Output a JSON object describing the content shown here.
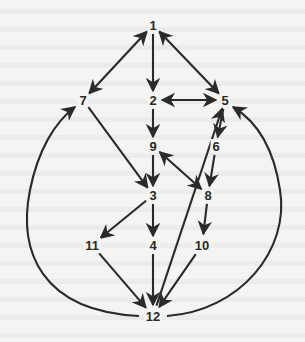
{
  "diagram": {
    "type": "directed-graph",
    "colors": {
      "ink": "#2a2a2a",
      "paper": "#f4f4f2"
    },
    "nodes": [
      {
        "id": "1",
        "label": "1",
        "x": 153,
        "y": 25
      },
      {
        "id": "2",
        "label": "2",
        "x": 153,
        "y": 100
      },
      {
        "id": "5",
        "label": "5",
        "x": 225,
        "y": 100
      },
      {
        "id": "7",
        "label": "7",
        "x": 83,
        "y": 100
      },
      {
        "id": "9",
        "label": "9",
        "x": 153,
        "y": 146
      },
      {
        "id": "6",
        "label": "6",
        "x": 216,
        "y": 146
      },
      {
        "id": "3",
        "label": "3",
        "x": 153,
        "y": 195
      },
      {
        "id": "8",
        "label": "8",
        "x": 208,
        "y": 195
      },
      {
        "id": "11",
        "label": "11",
        "x": 92,
        "y": 245
      },
      {
        "id": "4",
        "label": "4",
        "x": 153,
        "y": 245
      },
      {
        "id": "10",
        "label": "10",
        "x": 202,
        "y": 245
      },
      {
        "id": "12",
        "label": "12",
        "x": 153,
        "y": 316
      }
    ],
    "edges": [
      {
        "from": "1",
        "to": "2",
        "bidirectional": false,
        "shape": "straight"
      },
      {
        "from": "1",
        "to": "7",
        "bidirectional": true,
        "shape": "straight"
      },
      {
        "from": "1",
        "to": "5",
        "bidirectional": true,
        "shape": "straight"
      },
      {
        "from": "2",
        "to": "5",
        "bidirectional": true,
        "shape": "straight"
      },
      {
        "from": "2",
        "to": "9",
        "bidirectional": false,
        "shape": "straight"
      },
      {
        "from": "9",
        "to": "3",
        "bidirectional": false,
        "shape": "straight"
      },
      {
        "from": "7",
        "to": "3",
        "bidirectional": false,
        "shape": "straight"
      },
      {
        "from": "5",
        "to": "6",
        "bidirectional": false,
        "shape": "straight"
      },
      {
        "from": "6",
        "to": "8",
        "bidirectional": false,
        "shape": "straight"
      },
      {
        "from": "8",
        "to": "9",
        "bidirectional": true,
        "shape": "straight"
      },
      {
        "from": "12",
        "to": "5",
        "bidirectional": false,
        "shape": "straight"
      },
      {
        "from": "3",
        "to": "11",
        "bidirectional": false,
        "shape": "straight"
      },
      {
        "from": "3",
        "to": "4",
        "bidirectional": false,
        "shape": "straight"
      },
      {
        "from": "8",
        "to": "10",
        "bidirectional": false,
        "shape": "straight"
      },
      {
        "from": "11",
        "to": "12",
        "bidirectional": false,
        "shape": "straight"
      },
      {
        "from": "4",
        "to": "12",
        "bidirectional": false,
        "shape": "straight"
      },
      {
        "from": "10",
        "to": "12",
        "bidirectional": false,
        "shape": "straight"
      },
      {
        "from": "12",
        "to": "7",
        "bidirectional": false,
        "shape": "curve-left"
      },
      {
        "from": "12",
        "to": "5",
        "bidirectional": false,
        "shape": "curve-right"
      }
    ]
  }
}
